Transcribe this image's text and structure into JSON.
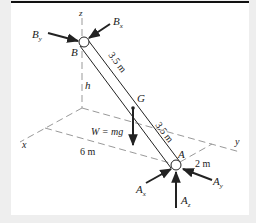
{
  "figure": {
    "type": "statics free-body diagram (3D rod with ball-and-socket ends)",
    "axes": {
      "x": "x",
      "y": "y",
      "z": "z"
    },
    "points": {
      "top": "B",
      "bottom": "A",
      "center_of_mass": "G"
    },
    "dimensions": {
      "upper_segment": "3.5 m",
      "lower_segment": "3.5 m",
      "height": "h",
      "x_distance": "6 m",
      "y_distance": "2 m"
    },
    "weight_label": "W = mg",
    "forces_at_B": [
      {
        "base": "B",
        "sub": "y"
      },
      {
        "base": "B",
        "sub": "x"
      }
    ],
    "forces_at_A": [
      {
        "base": "A",
        "sub": "x"
      },
      {
        "base": "A",
        "sub": "y"
      },
      {
        "base": "A",
        "sub": "z"
      }
    ],
    "colors": {
      "line": "#222222",
      "dash": "#999999",
      "panel": "#ffffff",
      "background": "#eeeeee"
    }
  }
}
